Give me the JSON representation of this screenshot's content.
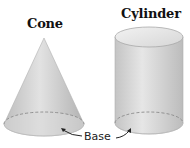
{
  "figure": {
    "shapes": [
      {
        "name": "Cone",
        "type": "cone"
      },
      {
        "name": "Cylinder",
        "type": "cylinder"
      }
    ],
    "annotation": {
      "label": "Base"
    }
  },
  "colors": {
    "solid_light": "#e4e4e4",
    "solid_mid": "#c8c8c8",
    "solid_dark": "#a8a8a8",
    "dashed_edge": "#8a8a8a",
    "text": "#111111"
  }
}
